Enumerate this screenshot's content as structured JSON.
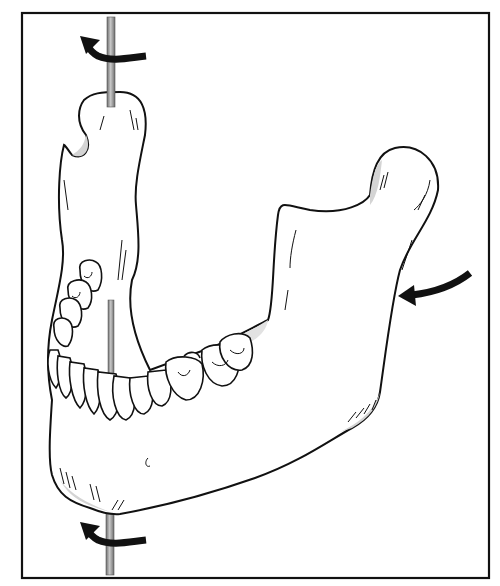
{
  "figure": {
    "colors": {
      "background": "#ffffff",
      "line": "#111111",
      "rod": "#9a9a9a",
      "shading": "#d4d4d4",
      "arrow": "#111111"
    },
    "elements": {
      "frame": "border-frame",
      "rod": "vertical-rotation-axis",
      "arrows": [
        {
          "name": "top-rotation-arrow",
          "direction": "left-up"
        },
        {
          "name": "bottom-rotation-arrow",
          "direction": "left-up"
        },
        {
          "name": "side-push-arrow",
          "direction": "left"
        }
      ]
    }
  }
}
